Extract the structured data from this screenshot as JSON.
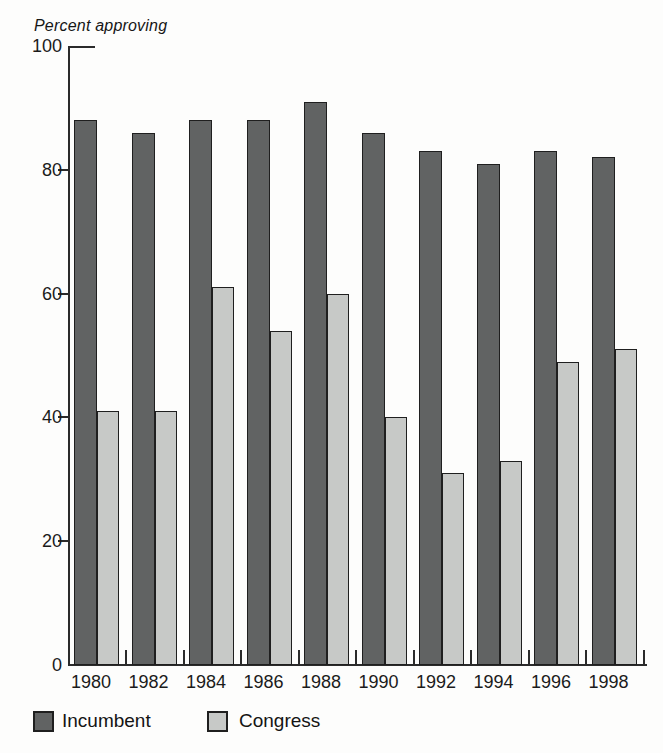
{
  "figure": {
    "background_color": "#fdfdfc",
    "axis_color": "#2b2b2b",
    "text_color": "#1b1b1b"
  },
  "chart_data": {
    "type": "bar",
    "title": "Percent approving",
    "ylabel": "Percent approving",
    "xlabel": "",
    "categories": [
      "1980",
      "1982",
      "1984",
      "1986",
      "1988",
      "1990",
      "1992",
      "1994",
      "1996",
      "1998"
    ],
    "series": [
      {
        "name": "Incumbent",
        "color": "#616363",
        "values": [
          88,
          86,
          88,
          88,
          91,
          86,
          83,
          81,
          83,
          82
        ]
      },
      {
        "name": "Congress",
        "color": "#c7c9c7",
        "values": [
          41,
          41,
          61,
          54,
          60,
          40,
          31,
          33,
          49,
          51
        ]
      }
    ],
    "ylim": [
      0,
      100
    ],
    "yticks": [
      0,
      20,
      40,
      60,
      80,
      100
    ],
    "grid": false,
    "legend_position": "bottom"
  }
}
